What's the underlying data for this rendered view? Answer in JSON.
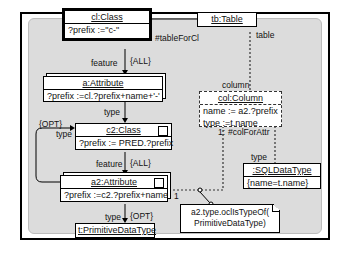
{
  "nodes": {
    "cl": {
      "title": "cl:Class",
      "body": "?prefix :=\"c-\""
    },
    "tb": {
      "title": "tb:Table"
    },
    "a": {
      "title": "a:Attribute",
      "body": "?prefix :=cl.?prefix+name+'-'"
    },
    "c2": {
      "title": "c2:Class",
      "body": "?prefix := PRED.?prefix"
    },
    "a2": {
      "title": "a2:Attribute",
      "body": "?prefix :=c2.?prefix+name"
    },
    "t": {
      "title": "t:PrimitiveDataType"
    },
    "col": {
      "title": "col:Column",
      "body1": "name := a2.?prefix",
      "body2": "type :=t.name"
    },
    "sql": {
      "title": ":SQLDataType",
      "body": "{name=t.name}"
    }
  },
  "labels": {
    "tableForCl": "#tableForCl",
    "table": "table",
    "feature1": "feature",
    "all1": "{ALL}",
    "type1": "type",
    "opt1": "{OPT}",
    "type_loop": "type",
    "feature2": "feature",
    "all2": "{ALL}",
    "type2": "type",
    "opt2": "{OPT}",
    "column": "column",
    "colForAttr": "#colForAttr",
    "one_a": "1:",
    "type3": "type",
    "one_b": "1"
  },
  "note": {
    "line1": "a2.type.oclIsTypeOf(",
    "line2": "PrimitiveDataType)"
  }
}
